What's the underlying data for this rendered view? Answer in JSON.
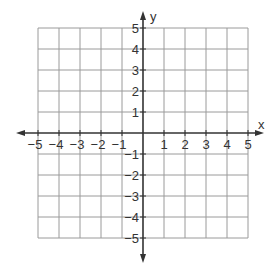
{
  "diagram": {
    "type": "coordinate-plane",
    "x_axis": {
      "label": "x",
      "min": -5,
      "max": 5,
      "ticks": [
        -5,
        -4,
        -3,
        -2,
        -1,
        1,
        2,
        3,
        4,
        5
      ]
    },
    "y_axis": {
      "label": "y",
      "min": -5,
      "max": 5,
      "ticks": [
        -5,
        -4,
        -3,
        -2,
        -1,
        1,
        2,
        3,
        4,
        5
      ]
    },
    "grid": {
      "on": true,
      "step": 1
    },
    "colors": {
      "grid": "#9a9a9a",
      "axis": "#333333",
      "text": "#333333"
    }
  },
  "layout": {
    "origin_x": 143,
    "origin_y": 133,
    "cell": 21
  }
}
